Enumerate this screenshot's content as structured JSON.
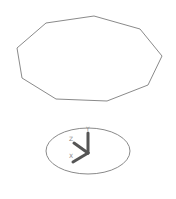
{
  "viewport": {
    "background": "#ffffff",
    "polygon": {
      "shape": "nonagon",
      "stroke": "#8a8a8a",
      "points": "46,23 94,16 140,29 162,56 148,85 107,101 56,99 22,78 17,48"
    },
    "orientation_gizmo": {
      "ellipse": {
        "cx": 88,
        "cy": 151,
        "rx": 42,
        "ry": 23,
        "stroke": "#8a8a8a"
      },
      "axis_color": "#555555",
      "labels": {
        "y": "Y",
        "z": "Z",
        "x": "X"
      }
    }
  }
}
